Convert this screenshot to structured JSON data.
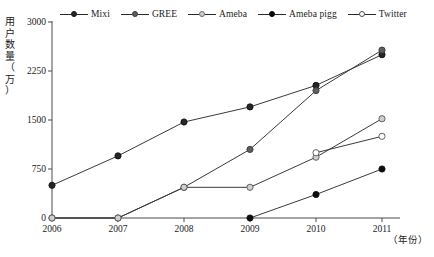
{
  "chart_data": {
    "type": "line",
    "title": "",
    "xlabel": "（年份）",
    "ylabel": "用户数量（万）",
    "ylabel_chars": [
      "用",
      "户",
      "数",
      "量",
      "（",
      "万",
      "）"
    ],
    "categories": [
      "2006",
      "2007",
      "2008",
      "2009",
      "2010",
      "2011"
    ],
    "x": [
      2006,
      2007,
      2008,
      2009,
      2010,
      2011
    ],
    "ylim": [
      0,
      3000
    ],
    "xlim": [
      2006,
      2011
    ],
    "yticks": [
      0,
      750,
      1500,
      2250,
      3000
    ],
    "ytick_labels": [
      "0",
      "750",
      "1500",
      "2250",
      "3000"
    ],
    "grid": false,
    "legend_position": "top",
    "series": [
      {
        "name": "Mixi",
        "marker": "filled-circle",
        "color": "#262626",
        "values": [
          500,
          950,
          1470,
          1700,
          2030,
          2500
        ]
      },
      {
        "name": "GREE",
        "marker": "filled-circle-gray",
        "color": "#5e5e5e",
        "values": [
          0,
          0,
          470,
          1050,
          1950,
          2570
        ]
      },
      {
        "name": "Ameba",
        "marker": "open-circle-gray",
        "color": "#cfcfcf",
        "values": [
          0,
          0,
          470,
          470,
          930,
          1520
        ]
      },
      {
        "name": "Ameba pigg",
        "marker": "filled-circle-black",
        "color": "#0d0d0d",
        "values": [
          null,
          null,
          null,
          0,
          360,
          750
        ]
      },
      {
        "name": "Twitter",
        "marker": "open-circle-white",
        "color": "#ffffff",
        "values": [
          null,
          null,
          null,
          null,
          1000,
          1250
        ]
      }
    ]
  },
  "legend": {
    "items": [
      {
        "label": "Mixi"
      },
      {
        "label": "GREE"
      },
      {
        "label": "Ameba"
      },
      {
        "label": "Ameba pigg"
      },
      {
        "label": "Twitter"
      }
    ]
  }
}
